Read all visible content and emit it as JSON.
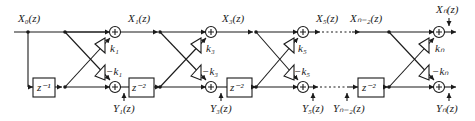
{
  "signals": {
    "x0": "X₀(z)",
    "x1": "X₁(z)",
    "x3": "X₃(z)",
    "x5": "X₅(z)",
    "xn2": "Xₙ₋₂(z)",
    "xn": "Xₙ(z)",
    "y1": "Y₁(z)",
    "y3": "Y₃(z)",
    "y5": "Y₅(z)",
    "yn2": "Yₙ₋₂(z)",
    "yn": "Yₙ(z)"
  },
  "coefficients": {
    "k1": "k₁",
    "mk1": "−k₁",
    "k3": "k₃",
    "mk3": "−k₃",
    "k5": "k₅",
    "mk5": "−k₅",
    "kn": "kₙ",
    "mkn": "−kₙ"
  },
  "delays": {
    "first": "z⁻¹",
    "d2": "z⁻²"
  },
  "colors": {
    "stroke": "#1a1a1a",
    "background": "#ffffff"
  }
}
